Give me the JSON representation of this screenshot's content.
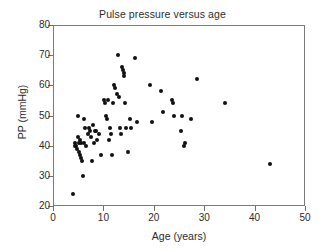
{
  "chart_data": {
    "type": "scatter",
    "title": "Pulse pressure versus age",
    "xlabel": "Age (years)",
    "ylabel": "PP (mmHg)",
    "xlim": [
      0,
      50
    ],
    "ylim": [
      20,
      80
    ],
    "xticks": [
      0,
      10,
      20,
      30,
      40,
      50
    ],
    "yticks": [
      20,
      30,
      40,
      50,
      60,
      70,
      80
    ],
    "xtick_labels": [
      "0",
      "10",
      "20",
      "30",
      "40",
      "50"
    ],
    "ytick_labels": [
      "20",
      "30",
      "40",
      "50",
      "60",
      "70",
      "80"
    ],
    "grid": false,
    "legend": null,
    "marker": "filled-circle",
    "marker_color": "#111111",
    "marker_size_px": 4,
    "n_points": 82,
    "series": [
      {
        "name": "Pulse pressure",
        "points": [
          [
            4.0,
            24
          ],
          [
            4.3,
            40
          ],
          [
            4.4,
            41
          ],
          [
            4.6,
            40
          ],
          [
            4.8,
            39
          ],
          [
            5.0,
            50
          ],
          [
            5.0,
            43
          ],
          [
            5.1,
            38
          ],
          [
            5.2,
            41
          ],
          [
            5.3,
            37
          ],
          [
            5.4,
            42
          ],
          [
            5.5,
            41
          ],
          [
            5.6,
            36
          ],
          [
            5.7,
            35
          ],
          [
            5.9,
            30
          ],
          [
            6.1,
            49
          ],
          [
            6.2,
            41
          ],
          [
            6.4,
            46
          ],
          [
            6.6,
            40
          ],
          [
            6.9,
            44
          ],
          [
            7.2,
            46
          ],
          [
            7.4,
            45
          ],
          [
            7.6,
            43
          ],
          [
            7.8,
            35
          ],
          [
            8.0,
            47
          ],
          [
            8.2,
            41
          ],
          [
            8.4,
            45
          ],
          [
            8.6,
            45
          ],
          [
            8.8,
            42
          ],
          [
            9.2,
            44
          ],
          [
            9.6,
            37
          ],
          [
            10.2,
            55
          ],
          [
            10.4,
            54
          ],
          [
            10.6,
            50
          ],
          [
            10.8,
            49
          ],
          [
            11.0,
            55
          ],
          [
            11.2,
            42
          ],
          [
            11.4,
            46
          ],
          [
            11.6,
            44
          ],
          [
            11.8,
            37
          ],
          [
            12.0,
            54
          ],
          [
            12.2,
            60
          ],
          [
            12.4,
            59
          ],
          [
            12.6,
            57
          ],
          [
            12.8,
            70
          ],
          [
            13.0,
            56
          ],
          [
            13.2,
            46
          ],
          [
            13.4,
            44
          ],
          [
            13.6,
            66
          ],
          [
            13.8,
            65
          ],
          [
            14.0,
            64
          ],
          [
            14.1,
            63
          ],
          [
            14.3,
            54
          ],
          [
            14.5,
            46
          ],
          [
            14.8,
            38
          ],
          [
            15.2,
            49
          ],
          [
            15.5,
            46
          ],
          [
            16.2,
            69
          ],
          [
            16.6,
            48
          ],
          [
            19.3,
            60
          ],
          [
            19.6,
            48
          ],
          [
            21.4,
            58
          ],
          [
            21.8,
            51
          ],
          [
            23.6,
            55
          ],
          [
            23.8,
            54
          ],
          [
            24.0,
            50
          ],
          [
            25.3,
            45
          ],
          [
            25.6,
            50
          ],
          [
            25.9,
            40
          ],
          [
            26.2,
            41
          ],
          [
            27.4,
            49
          ],
          [
            28.6,
            62
          ],
          [
            34.1,
            54
          ],
          [
            43.0,
            34
          ]
        ]
      }
    ]
  }
}
